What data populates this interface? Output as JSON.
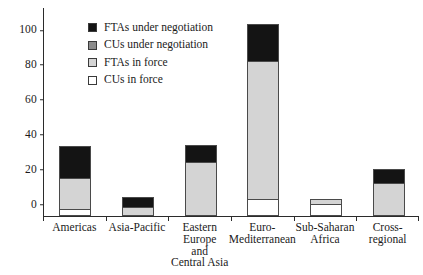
{
  "chart_data": {
    "type": "bar",
    "stacked": true,
    "title": "",
    "subtitle": "",
    "xlabel": "",
    "ylabel": "",
    "ylim": [
      0,
      120
    ],
    "yticks": [
      0,
      20,
      40,
      60,
      80,
      100,
      120
    ],
    "grid": false,
    "legend_position": "top-left",
    "categories": [
      "Americas",
      "Asia-Pacific",
      "Eastern Europe and Central Asia",
      "Euro-Mediterranean",
      "Sub-Saharan Africa",
      "Cross-regional"
    ],
    "category_label_lines": [
      [
        "Americas"
      ],
      [
        "Asia-Pacific"
      ],
      [
        "Eastern",
        "Europe",
        "and",
        "Central Asia"
      ],
      [
        "Euro-",
        "Mediterranean"
      ],
      [
        "Sub-Saharan",
        "Africa"
      ],
      [
        "Cross-",
        "regional"
      ]
    ],
    "series": [
      {
        "name": "CUs in force",
        "color": "#ffffff",
        "values": [
          4,
          0,
          0,
          10,
          7,
          0
        ]
      },
      {
        "name": "FTAs in force",
        "color": "#d4d4d4",
        "values": [
          18,
          5,
          31,
          79,
          3,
          19
        ]
      },
      {
        "name": "CUs under negotiation",
        "color": "#8c8c8c",
        "values": [
          0,
          0,
          0,
          0,
          0,
          0
        ]
      },
      {
        "name": "FTAs under negotiation",
        "color": "#141414",
        "values": [
          18,
          6,
          10,
          21,
          0,
          8
        ]
      }
    ],
    "totals": [
      40,
      11,
      41,
      110,
      10,
      27
    ]
  },
  "legend": {
    "items": [
      {
        "label": "FTAs under negotiation",
        "color": "#141414",
        "icon": "legend-swatch-filled-black"
      },
      {
        "label": "CUs under negotiation",
        "color": "#8c8c8c",
        "icon": "legend-swatch-dark-gray"
      },
      {
        "label": "FTAs in force",
        "color": "#d4d4d4",
        "icon": "legend-swatch-light-gray"
      },
      {
        "label": "CUs in force",
        "color": "#ffffff",
        "icon": "legend-swatch-white"
      }
    ]
  },
  "axis": {
    "y_tick_labels": [
      "120",
      "100",
      "80",
      "60",
      "40",
      "20",
      "0"
    ],
    "y_tick_values": [
      120,
      100,
      80,
      60,
      40,
      20,
      0
    ]
  },
  "colors": {
    "axis": "#2b2b2b",
    "bar_outline": "#4a4a4a",
    "text": "#1a1a1a",
    "background": "#ffffff"
  }
}
